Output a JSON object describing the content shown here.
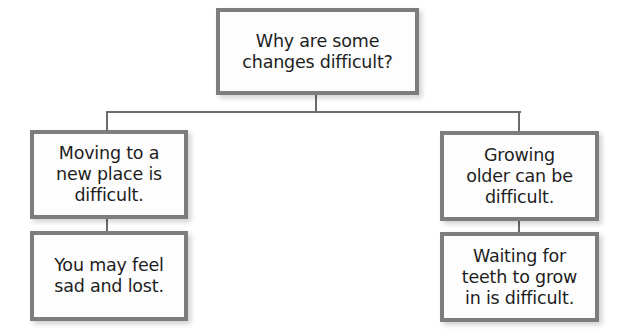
{
  "diagram": {
    "type": "tree",
    "colors": {
      "border": "#7d7d7d",
      "connector": "#6b6b6b",
      "text": "#1e1e1e",
      "box_fill": "#fdfdfd"
    },
    "root": {
      "text": "Why are some\nchanges difficult?"
    },
    "branches": [
      {
        "main": {
          "text": "Moving to a\nnew place is\ndifficult."
        },
        "detail": {
          "text": "You may feel\nsad and lost."
        }
      },
      {
        "main": {
          "text": "Growing\nolder can be\ndifficult."
        },
        "detail": {
          "text": "Waiting for\nteeth to grow\nin is difficult."
        }
      }
    ]
  }
}
